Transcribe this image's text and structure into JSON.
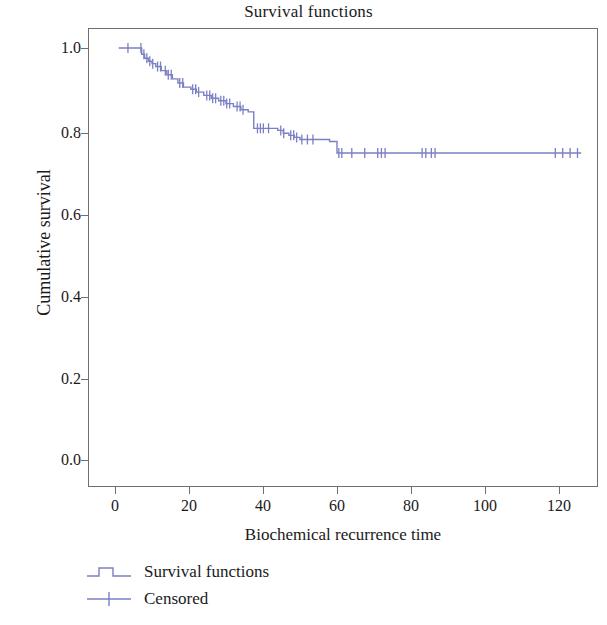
{
  "chart_data": {
    "type": "line",
    "subtype": "kaplan-meier-survival",
    "title": "Survival functions",
    "xlabel": "Biochemical recurrence time",
    "ylabel": "Cumulative survival",
    "xlim": [
      -4,
      133
    ],
    "ylim": [
      0.0,
      1.06
    ],
    "xticks": [
      0,
      20,
      40,
      60,
      80,
      100,
      120
    ],
    "xtick_labels": [
      "0",
      "20",
      "40",
      "60",
      "80",
      "100",
      "120"
    ],
    "yticks": [
      0.0,
      0.2,
      0.4,
      0.6,
      0.8,
      1.0
    ],
    "ytick_labels": [
      "0.0",
      "0.2",
      "0.4",
      "0.6",
      "0.8",
      "1.0"
    ],
    "grid": false,
    "legend_position": "below-left",
    "line_color": "#7b7fc4",
    "frame_color": "#6f6f6f",
    "background": "#ffffff",
    "series": [
      {
        "name": "Survival functions",
        "kind": "step",
        "x": [
          1.0,
          6.5,
          7.2,
          8.0,
          9.0,
          10.0,
          11.0,
          12.5,
          14.0,
          15.5,
          17.0,
          18.5,
          20.5,
          22.0,
          24.0,
          26.0,
          28.0,
          30.0,
          32.0,
          34.0,
          36.0,
          37.5,
          44.0,
          45.5,
          47.0,
          48.5,
          50.0,
          58.0,
          60.0,
          126.0
        ],
        "y": [
          1.0,
          1.0,
          0.985,
          0.975,
          0.968,
          0.962,
          0.955,
          0.945,
          0.935,
          0.925,
          0.915,
          0.905,
          0.9,
          0.893,
          0.885,
          0.878,
          0.872,
          0.865,
          0.858,
          0.85,
          0.845,
          0.805,
          0.8,
          0.793,
          0.788,
          0.783,
          0.778,
          0.773,
          0.745,
          0.745
        ]
      },
      {
        "name": "Censored",
        "kind": "tick-marks",
        "x": [
          3.5,
          7.0,
          7.8,
          8.6,
          9.4,
          10.2,
          11.5,
          12.3,
          13.6,
          14.4,
          15.2,
          17.5,
          18.3,
          21.0,
          21.8,
          22.6,
          24.8,
          25.6,
          26.4,
          27.2,
          28.6,
          29.4,
          30.2,
          31.0,
          33.0,
          33.8,
          34.6,
          38.5,
          39.3,
          40.1,
          41.5,
          44.8,
          45.6,
          47.5,
          48.3,
          49.1,
          50.5,
          52.0,
          53.5,
          60.5,
          61.3,
          64.0,
          67.5,
          71.0,
          72.0,
          73.0,
          83.0,
          84.0,
          85.5,
          86.5,
          119.0,
          121.0,
          123.0,
          125.0
        ]
      }
    ]
  },
  "title": {
    "text": "Survival functions"
  },
  "axes": {
    "y_title": "Cumulative survival",
    "x_title": "Biochemical recurrence time",
    "y_labels": [
      "1.0",
      "0.8",
      "0.6",
      "0.4",
      "0.2",
      "0.0"
    ],
    "x_labels": [
      "0",
      "20",
      "40",
      "60",
      "80",
      "100",
      "120"
    ]
  },
  "legend": {
    "items": [
      {
        "label": "Survival functions",
        "glyph": "step-line-icon",
        "color": "#7b7fc4"
      },
      {
        "label": "Censored",
        "glyph": "plus-tick-icon",
        "color": "#7b7fc4"
      }
    ]
  }
}
